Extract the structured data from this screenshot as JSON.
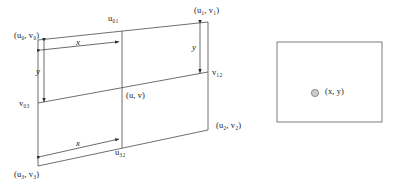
{
  "figure": {
    "title": "",
    "type": "geometry-diagram",
    "stroke_color": "#4a4a4a",
    "text_color": "#1a1a1a",
    "background": "#ffffff",
    "marker_fill": "#cccccc",
    "quad_labels": {
      "corner_top_left": "(u₀, v₀)",
      "corner_top_right": "(u₁, v₁)",
      "corner_bottom_right": "(u₂, v₂)",
      "corner_bottom_left": "(u₃, v₃)",
      "edge_top": "u₀₁",
      "edge_bottom": "u₃₂",
      "edge_right": "v₁₂",
      "edge_left": "v₀₃",
      "interior_point": "(u, v)",
      "dim_x_top": "x",
      "dim_x_bottom": "x",
      "dim_y_left": "y",
      "dim_y_right": "y"
    },
    "rect_labels": {
      "point": "(x, y)"
    }
  }
}
